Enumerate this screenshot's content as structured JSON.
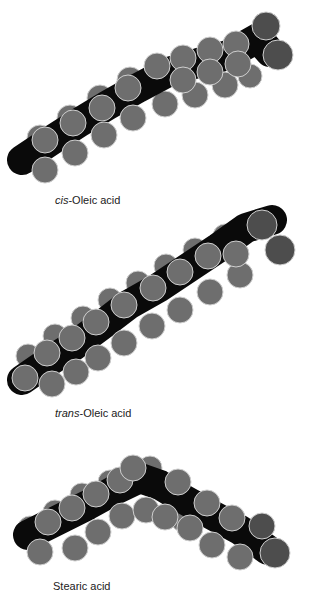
{
  "colors": {
    "background": "#ffffff",
    "carbon_sphere": "#6e6e6e",
    "oxygen_sphere": "#4d4d4d",
    "backbone": "#0a0a0a",
    "outline": "#cfcfcf",
    "label_text": "#222222"
  },
  "molecules": [
    {
      "id": "cis-oleic",
      "label_prefix": "cis",
      "label_suffix": "-Oleic acid",
      "label_pos": {
        "x": 55,
        "y": 194
      },
      "shape": "straight",
      "spine": [
        [
          22,
          160
        ],
        [
          52,
          140
        ],
        [
          80,
          122
        ],
        [
          108,
          105
        ],
        [
          138,
          88
        ],
        [
          168,
          72
        ],
        [
          198,
          63
        ],
        [
          228,
          55
        ],
        [
          258,
          38
        ],
        [
          270,
          52
        ]
      ],
      "carbons": [
        {
          "x": 22,
          "y": 160,
          "r": 13,
          "back": true
        },
        {
          "x": 40,
          "y": 138,
          "r": 13,
          "back": true
        },
        {
          "x": 45,
          "y": 170,
          "r": 13
        },
        {
          "x": 45,
          "y": 140,
          "r": 13
        },
        {
          "x": 70,
          "y": 118,
          "r": 13,
          "back": true
        },
        {
          "x": 75,
          "y": 153,
          "r": 13
        },
        {
          "x": 73,
          "y": 123,
          "r": 13
        },
        {
          "x": 100,
          "y": 98,
          "r": 13,
          "back": true
        },
        {
          "x": 104,
          "y": 135,
          "r": 13
        },
        {
          "x": 102,
          "y": 108,
          "r": 13
        },
        {
          "x": 130,
          "y": 80,
          "r": 13,
          "back": true
        },
        {
          "x": 133,
          "y": 118,
          "r": 13
        },
        {
          "x": 128,
          "y": 88,
          "r": 13
        },
        {
          "x": 157,
          "y": 66,
          "r": 13
        },
        {
          "x": 165,
          "y": 104,
          "r": 13,
          "back": true
        },
        {
          "x": 183,
          "y": 58,
          "r": 13
        },
        {
          "x": 183,
          "y": 80,
          "r": 13
        },
        {
          "x": 195,
          "y": 95,
          "r": 13,
          "back": true
        },
        {
          "x": 210,
          "y": 50,
          "r": 13
        },
        {
          "x": 210,
          "y": 72,
          "r": 13
        },
        {
          "x": 225,
          "y": 85,
          "r": 13,
          "back": true
        },
        {
          "x": 236,
          "y": 44,
          "r": 13
        },
        {
          "x": 238,
          "y": 64,
          "r": 13
        },
        {
          "x": 250,
          "y": 76,
          "r": 12,
          "back": true
        }
      ],
      "oxygens": [
        {
          "x": 266,
          "y": 26,
          "r": 14
        },
        {
          "x": 278,
          "y": 55,
          "r": 15
        }
      ]
    },
    {
      "id": "trans-oleic",
      "label_prefix": "trans",
      "label_suffix": "-Oleic acid",
      "label_pos": {
        "x": 55,
        "y": 407
      },
      "shape": "straight",
      "spine": [
        [
          22,
          380
        ],
        [
          48,
          362
        ],
        [
          75,
          345
        ],
        [
          102,
          325
        ],
        [
          128,
          305
        ],
        [
          158,
          288
        ],
        [
          188,
          268
        ],
        [
          218,
          248
        ],
        [
          246,
          228
        ],
        [
          272,
          220
        ]
      ],
      "carbons": [
        {
          "x": 28,
          "y": 356,
          "r": 12,
          "back": true
        },
        {
          "x": 25,
          "y": 378,
          "r": 13
        },
        {
          "x": 52,
          "y": 384,
          "r": 13
        },
        {
          "x": 47,
          "y": 353,
          "r": 13
        },
        {
          "x": 55,
          "y": 336,
          "r": 12,
          "back": true
        },
        {
          "x": 76,
          "y": 372,
          "r": 13
        },
        {
          "x": 72,
          "y": 338,
          "r": 13
        },
        {
          "x": 83,
          "y": 318,
          "r": 12,
          "back": true
        },
        {
          "x": 98,
          "y": 358,
          "r": 13
        },
        {
          "x": 96,
          "y": 322,
          "r": 13
        },
        {
          "x": 110,
          "y": 300,
          "r": 12,
          "back": true
        },
        {
          "x": 124,
          "y": 343,
          "r": 13
        },
        {
          "x": 124,
          "y": 305,
          "r": 13
        },
        {
          "x": 138,
          "y": 283,
          "r": 12,
          "back": true
        },
        {
          "x": 152,
          "y": 326,
          "r": 13
        },
        {
          "x": 153,
          "y": 288,
          "r": 13
        },
        {
          "x": 166,
          "y": 266,
          "r": 12,
          "back": true
        },
        {
          "x": 180,
          "y": 310,
          "r": 13
        },
        {
          "x": 180,
          "y": 272,
          "r": 13
        },
        {
          "x": 195,
          "y": 250,
          "r": 12,
          "back": true
        },
        {
          "x": 210,
          "y": 292,
          "r": 13
        },
        {
          "x": 208,
          "y": 256,
          "r": 13
        },
        {
          "x": 225,
          "y": 236,
          "r": 12,
          "back": true
        },
        {
          "x": 240,
          "y": 275,
          "r": 13
        },
        {
          "x": 236,
          "y": 254,
          "r": 13
        }
      ],
      "oxygens": [
        {
          "x": 262,
          "y": 225,
          "r": 15
        },
        {
          "x": 280,
          "y": 250,
          "r": 15
        }
      ]
    },
    {
      "id": "stearic",
      "label_prefix": "",
      "label_suffix": "Stearic acid",
      "label_pos": {
        "x": 53,
        "y": 580
      },
      "shape": "bent",
      "spine": [
        [
          28,
          535
        ],
        [
          58,
          520
        ],
        [
          88,
          505
        ],
        [
          115,
          490
        ],
        [
          140,
          478
        ],
        [
          160,
          485
        ],
        [
          185,
          500
        ],
        [
          212,
          515
        ],
        [
          240,
          530
        ],
        [
          268,
          550
        ]
      ],
      "carbons": [
        {
          "x": 30,
          "y": 528,
          "r": 12,
          "back": true
        },
        {
          "x": 40,
          "y": 552,
          "r": 13
        },
        {
          "x": 48,
          "y": 522,
          "r": 13
        },
        {
          "x": 55,
          "y": 512,
          "r": 12,
          "back": true
        },
        {
          "x": 75,
          "y": 548,
          "r": 13
        },
        {
          "x": 72,
          "y": 508,
          "r": 13
        },
        {
          "x": 82,
          "y": 495,
          "r": 12,
          "back": true
        },
        {
          "x": 98,
          "y": 532,
          "r": 13
        },
        {
          "x": 96,
          "y": 494,
          "r": 13
        },
        {
          "x": 110,
          "y": 482,
          "r": 12,
          "back": true
        },
        {
          "x": 122,
          "y": 516,
          "r": 13
        },
        {
          "x": 120,
          "y": 480,
          "r": 13
        },
        {
          "x": 133,
          "y": 468,
          "r": 13
        },
        {
          "x": 150,
          "y": 468,
          "r": 12,
          "back": true
        },
        {
          "x": 146,
          "y": 510,
          "r": 13
        },
        {
          "x": 165,
          "y": 517,
          "r": 13
        },
        {
          "x": 178,
          "y": 482,
          "r": 13
        },
        {
          "x": 183,
          "y": 520,
          "r": 12,
          "back": true
        },
        {
          "x": 190,
          "y": 528,
          "r": 13
        },
        {
          "x": 207,
          "y": 503,
          "r": 13
        },
        {
          "x": 212,
          "y": 545,
          "r": 13
        },
        {
          "x": 232,
          "y": 518,
          "r": 13
        },
        {
          "x": 240,
          "y": 557,
          "r": 13
        },
        {
          "x": 258,
          "y": 528,
          "r": 12,
          "back": true
        }
      ],
      "oxygens": [
        {
          "x": 262,
          "y": 526,
          "r": 13
        },
        {
          "x": 275,
          "y": 553,
          "r": 15
        }
      ]
    }
  ]
}
